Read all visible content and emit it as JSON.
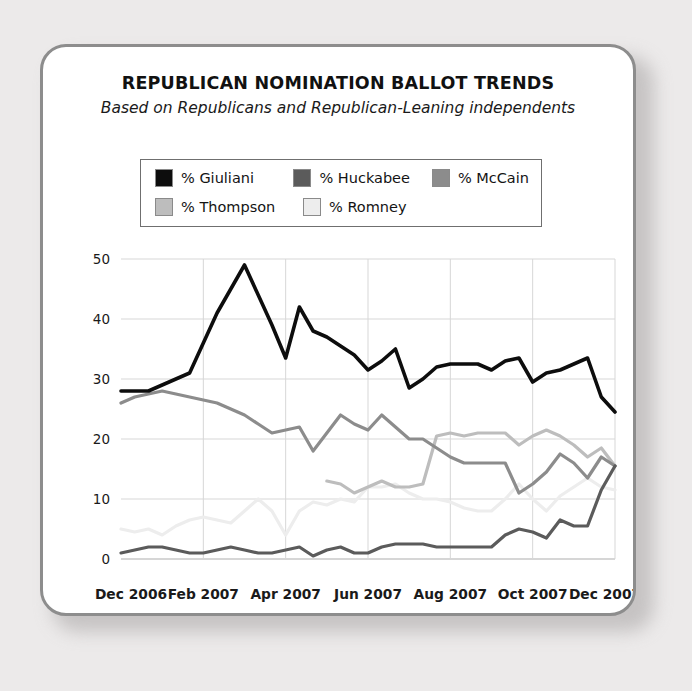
{
  "card": {
    "title": "REPUBLICAN NOMINATION BALLOT TRENDS",
    "subtitle": "Based on Republicans and Republican-Leaning independents"
  },
  "legend": {
    "items": [
      {
        "label": "% Giuliani",
        "color": "#0d0d0d"
      },
      {
        "label": "% Huckabee",
        "color": "#5b5b5b"
      },
      {
        "label": "% McCain",
        "color": "#8c8c8c"
      },
      {
        "label": "% Thompson",
        "color": "#bdbdbd"
      },
      {
        "label": "% Romney",
        "color": "#ededed"
      }
    ]
  },
  "chart_data": {
    "type": "line",
    "title": "REPUBLICAN NOMINATION BALLOT TRENDS",
    "subtitle": "Based on Republicans and Republican-Leaning independents",
    "xlabel": "",
    "ylabel": "",
    "ylim": [
      0,
      50
    ],
    "yticks": [
      0,
      10,
      20,
      30,
      40,
      50
    ],
    "xticks": [
      "Dec 2006",
      "Feb 2007",
      "Apr 2007",
      "Jun 2007",
      "Aug 2007",
      "Oct 2007",
      "Dec 2007"
    ],
    "xtick_index": [
      0,
      6,
      12,
      18,
      24,
      30,
      36
    ],
    "x_count": 37,
    "grid": true,
    "legend_position": "top",
    "series": [
      {
        "name": "% Giuliani",
        "color": "#0d0d0d",
        "values": [
          28,
          28,
          28,
          29,
          30,
          31,
          36,
          41,
          45,
          49,
          44,
          39,
          33.5,
          42,
          38,
          37,
          35.5,
          34,
          31.5,
          33,
          35,
          28.5,
          30,
          32,
          32.5,
          32.5,
          32.5,
          31.5,
          33,
          33.5,
          29.5,
          31,
          31.5,
          32.5,
          33.5,
          27,
          24.5
        ]
      },
      {
        "name": "% Huckabee",
        "color": "#5b5b5b",
        "values": [
          1,
          1.5,
          2,
          2,
          1.5,
          1,
          1,
          1.5,
          2,
          1.5,
          1,
          1,
          1.5,
          2,
          0.5,
          1.5,
          2,
          1,
          1,
          2,
          2.5,
          2.5,
          2.5,
          2,
          2,
          2,
          2,
          2,
          4,
          5,
          4.5,
          3.5,
          6.5,
          5.5,
          5.5,
          11.5,
          15.5
        ]
      },
      {
        "name": "% McCain",
        "color": "#8c8c8c",
        "values": [
          26,
          27,
          27.5,
          28,
          27.5,
          27,
          26.5,
          26,
          25,
          24,
          22.5,
          21,
          21.5,
          22,
          18,
          21,
          24,
          22.5,
          21.5,
          24,
          22,
          20,
          20,
          18.5,
          17,
          16,
          16,
          16,
          16,
          11,
          12.5,
          14.5,
          17.5,
          16,
          13.5,
          17,
          15.5
        ]
      },
      {
        "name": "% Thompson",
        "color": "#bdbdbd",
        "values": [
          null,
          null,
          null,
          null,
          null,
          null,
          null,
          null,
          null,
          null,
          null,
          null,
          null,
          null,
          null,
          13,
          12.5,
          11,
          12,
          13,
          12,
          12,
          12.5,
          20.5,
          21,
          20.5,
          21,
          21,
          21,
          19,
          20.5,
          21.5,
          20.5,
          19,
          17,
          18.5,
          15.5
        ]
      },
      {
        "name": "% Romney",
        "color": "#ededed",
        "values": [
          5,
          4.5,
          5,
          4,
          5.5,
          6.5,
          7,
          6.5,
          6,
          8,
          10,
          8,
          4,
          8,
          9.5,
          9,
          10,
          9.5,
          12,
          12,
          12.5,
          11,
          10,
          10,
          9.5,
          8.5,
          8,
          8,
          10,
          12.5,
          10,
          8,
          10.5,
          12,
          13.5,
          12,
          11.5
        ]
      }
    ]
  }
}
